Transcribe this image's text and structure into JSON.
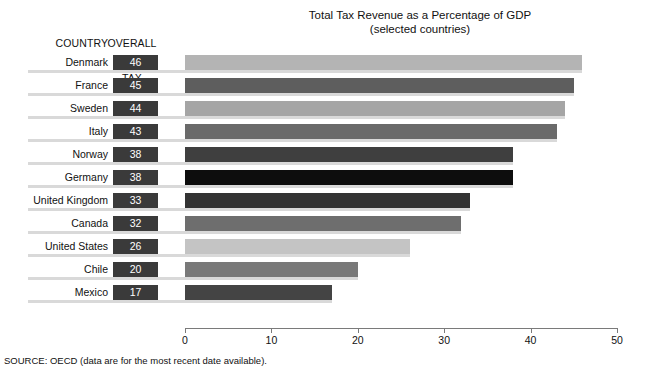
{
  "headers": {
    "country": "COUNTRY",
    "burden_line1": "OVERALL",
    "burden_line2": "TAX",
    "burden_line3": "BURDEN"
  },
  "source_note": "SOURCE: OECD (data are for the most recent date available).",
  "chart_data": {
    "type": "bar",
    "orientation": "horizontal",
    "title": "Total Tax Revenue as a Percentage of GDP",
    "subtitle": "(selected countries)",
    "xlabel": "",
    "ylabel": "",
    "xlim": [
      0,
      50
    ],
    "xticks": [
      0,
      10,
      20,
      30,
      40,
      50
    ],
    "xtick_labels": [
      "0",
      "10",
      "20",
      "30",
      "40",
      "50"
    ],
    "grid": false,
    "legend": false,
    "categories": [
      "Denmark",
      "France",
      "Sweden",
      "Italy",
      "Norway",
      "Germany",
      "United Kingdom",
      "Canada",
      "United States",
      "Chile",
      "Mexico"
    ],
    "values": [
      46,
      45,
      44,
      43,
      38,
      38,
      33,
      32,
      26,
      20,
      17
    ],
    "value_labels": [
      "46",
      "45",
      "44",
      "43",
      "38",
      "38",
      "33",
      "32",
      "26",
      "20",
      "17"
    ],
    "bar_colors": [
      "#b4b4b4",
      "#5e5e5e",
      "#a5a5a5",
      "#6a6a6a",
      "#3f3f3f",
      "#0d0d0d",
      "#333333",
      "#6e6e6e",
      "#c4c4c4",
      "#797979",
      "#444444"
    ]
  },
  "colors": {
    "value_box_bg": "#3a3a3a",
    "value_box_text": "#ffffff",
    "row_shadow": "#d9d9d9",
    "axis": "#7a7a7a",
    "background": "#ffffff"
  }
}
